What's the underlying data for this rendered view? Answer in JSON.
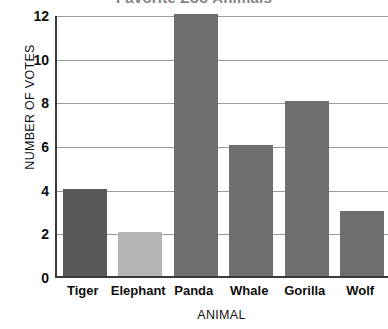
{
  "chart_data": {
    "type": "bar",
    "title": "Favorite Zoo Animals",
    "xlabel": "ANIMAL",
    "ylabel": "NUMBER OF VOTES",
    "categories": [
      "Tiger",
      "Elephant",
      "Panda",
      "Whale",
      "Gorilla",
      "Wolf"
    ],
    "values": [
      4,
      2,
      12,
      6,
      8,
      3
    ],
    "ylim": [
      0,
      12
    ],
    "yticks": [
      0,
      2,
      4,
      6,
      8,
      10,
      12
    ],
    "ytick_labels": [
      "0",
      "2",
      "4",
      "6",
      "8",
      "10",
      "12"
    ],
    "grid": "horizontal",
    "legend": "none",
    "bar_colors": [
      "#595959",
      "#b5b5b5",
      "#6e6e6e",
      "#6e6e6e",
      "#6e6e6e",
      "#6e6e6e"
    ]
  },
  "style": {
    "axis_color": "#3b3b3b",
    "grid_color": "#9a9a9a",
    "text_color": "#0d0d0d",
    "background": "#ffffff"
  }
}
